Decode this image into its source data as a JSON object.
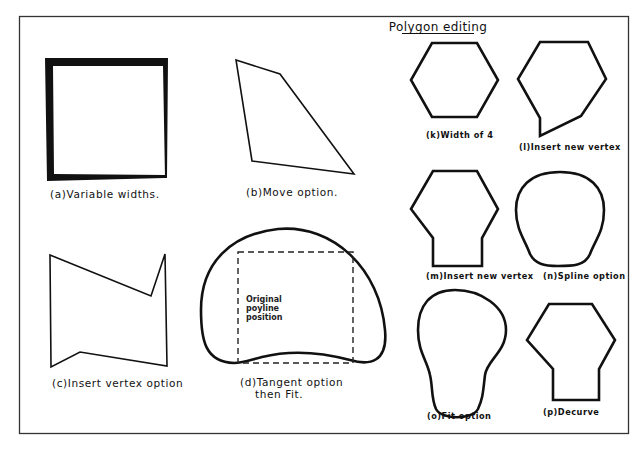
{
  "title": "Polygon editing",
  "figures": {
    "a": {
      "label": "(a)Variable widths."
    },
    "b": {
      "label": "(b)Move option."
    },
    "c": {
      "label": "(c)Insert vertex option"
    },
    "d": {
      "label_line1": "(d)Tangent option",
      "label_line2": "then Fit.",
      "annotation_line1": "Original",
      "annotation_line2": "poyline",
      "annotation_line3": "position"
    },
    "k": {
      "label": "(k)Width of 4"
    },
    "l": {
      "label": "(l)Insert new vertex"
    },
    "m": {
      "label": "(m)Insert new vertex"
    },
    "n": {
      "label": "(n)Spline option"
    },
    "o": {
      "label": "(o)Fit option"
    },
    "p": {
      "label": "(p)Decurve"
    }
  },
  "colors": {
    "stroke": "#111111",
    "background": "#ffffff",
    "frame": "#333333"
  }
}
